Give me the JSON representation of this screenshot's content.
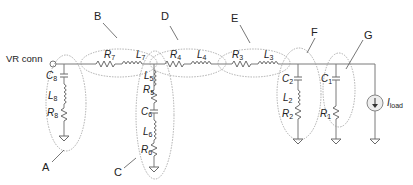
{
  "diagram": {
    "source_label": "VR conn",
    "load_label": {
      "main": "I",
      "sub": "load"
    },
    "groups": [
      {
        "id": "A",
        "label": "A",
        "components": [
          "C8",
          "L8",
          "R8"
        ]
      },
      {
        "id": "B",
        "label": "B",
        "components": [
          "R7",
          "L7"
        ]
      },
      {
        "id": "C",
        "label": "C",
        "components": [
          "L5",
          "R5",
          "C6",
          "L6",
          "R6"
        ]
      },
      {
        "id": "D",
        "label": "D",
        "components": [
          "R4",
          "L4"
        ]
      },
      {
        "id": "E",
        "label": "E",
        "components": [
          "R3",
          "L3"
        ]
      },
      {
        "id": "F",
        "label": "F",
        "components": [
          "C2",
          "L2",
          "R2"
        ]
      },
      {
        "id": "G",
        "label": "G",
        "components": [
          "C1",
          "R1"
        ]
      }
    ],
    "components": {
      "C8": {
        "main": "C",
        "sub": "8"
      },
      "L8": {
        "main": "L",
        "sub": "8"
      },
      "R8": {
        "main": "R",
        "sub": "8"
      },
      "R7": {
        "main": "R",
        "sub": "7"
      },
      "L7": {
        "main": "L",
        "sub": "7"
      },
      "L5": {
        "main": "L",
        "sub": "5"
      },
      "R5": {
        "main": "R",
        "sub": "5"
      },
      "C6": {
        "main": "C",
        "sub": "6"
      },
      "L6": {
        "main": "L",
        "sub": "6"
      },
      "R6": {
        "main": "R",
        "sub": "6"
      },
      "R4": {
        "main": "R",
        "sub": "4"
      },
      "L4": {
        "main": "L",
        "sub": "4"
      },
      "R3": {
        "main": "R",
        "sub": "3"
      },
      "L3": {
        "main": "L",
        "sub": "3"
      },
      "C2": {
        "main": "C",
        "sub": "2"
      },
      "L2": {
        "main": "L",
        "sub": "2"
      },
      "R2": {
        "main": "R",
        "sub": "2"
      },
      "C1": {
        "main": "C",
        "sub": "1"
      },
      "R1": {
        "main": "R",
        "sub": "1"
      }
    },
    "colors": {
      "wire": "#7a7a7a",
      "ellipse": "#9a9a9a",
      "text": "#222222"
    }
  }
}
